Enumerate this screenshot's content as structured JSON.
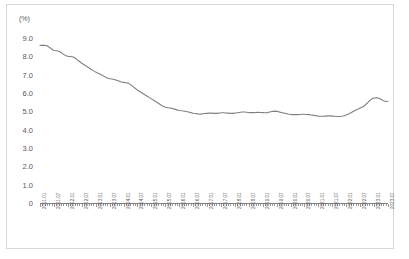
{
  "chart": {
    "unit_label": "(%)",
    "border_color": "#d9d9d9",
    "line_color": "#808080",
    "axis_color": "#808080",
    "text_color": "#595959"
  },
  "chart_data": {
    "type": "line",
    "title": "",
    "subtitle": "",
    "xlabel": "",
    "ylabel": "(%)",
    "grid": false,
    "legend": "none",
    "ylim": [
      0,
      9.0
    ],
    "ytick_labels": [
      "9.0",
      "8.0",
      "7.0",
      "6.0",
      "5.0",
      "4.0",
      "3.0",
      "2.0",
      "1.0",
      "0"
    ],
    "ytick_values": [
      9.0,
      8.0,
      7.0,
      6.0,
      5.0,
      4.0,
      3.0,
      2.0,
      1.0,
      0
    ],
    "xtick_labels": [
      "2011.01",
      "2011.07",
      "2012.01",
      "2012.07",
      "2013.01",
      "2013.07",
      "2014.01",
      "2014.07",
      "2015.01",
      "2015.07",
      "2016.01",
      "2016.07",
      "2017.01",
      "2017.07",
      "2018.01",
      "2018.07",
      "2019.01",
      "2019.07",
      "2020.01",
      "2020.07",
      "2021.01",
      "2021.07",
      "2022.01",
      "2022.07",
      "2023.01",
      "2023.07"
    ],
    "x_start": "2011.01",
    "x_end": "2023.07",
    "x_interval_months": 1,
    "series": [
      {
        "name": "",
        "values": [
          8.6,
          8.6,
          8.6,
          8.58,
          8.5,
          8.4,
          8.32,
          8.3,
          8.28,
          8.22,
          8.12,
          8.05,
          8.0,
          7.99,
          7.98,
          7.92,
          7.82,
          7.72,
          7.62,
          7.54,
          7.46,
          7.38,
          7.3,
          7.22,
          7.14,
          7.08,
          7.02,
          6.96,
          6.88,
          6.82,
          6.78,
          6.76,
          6.74,
          6.7,
          6.65,
          6.6,
          6.58,
          6.56,
          6.54,
          6.46,
          6.36,
          6.26,
          6.16,
          6.08,
          6.0,
          5.92,
          5.84,
          5.76,
          5.68,
          5.6,
          5.52,
          5.44,
          5.36,
          5.28,
          5.22,
          5.2,
          5.18,
          5.16,
          5.12,
          5.08,
          5.05,
          5.03,
          5.02,
          4.99,
          4.96,
          4.93,
          4.9,
          4.88,
          4.86,
          4.85,
          4.86,
          4.88,
          4.89,
          4.9,
          4.9,
          4.89,
          4.89,
          4.9,
          4.92,
          4.92,
          4.91,
          4.9,
          4.89,
          4.89,
          4.9,
          4.92,
          4.94,
          4.96,
          4.96,
          4.95,
          4.94,
          4.93,
          4.93,
          4.94,
          4.95,
          4.94,
          4.93,
          4.92,
          4.93,
          4.96,
          4.99,
          5.01,
          5.0,
          4.97,
          4.94,
          4.91,
          4.88,
          4.85,
          4.83,
          4.82,
          4.82,
          4.82,
          4.83,
          4.84,
          4.84,
          4.83,
          4.82,
          4.8,
          4.78,
          4.76,
          4.74,
          4.73,
          4.73,
          4.74,
          4.75,
          4.75,
          4.74,
          4.73,
          4.72,
          4.72,
          4.73,
          4.76,
          4.8,
          4.85,
          4.92,
          4.99,
          5.06,
          5.12,
          5.18,
          5.24,
          5.32,
          5.44,
          5.58,
          5.68,
          5.73,
          5.74,
          5.72,
          5.66,
          5.58,
          5.54,
          5.55
        ]
      }
    ]
  }
}
